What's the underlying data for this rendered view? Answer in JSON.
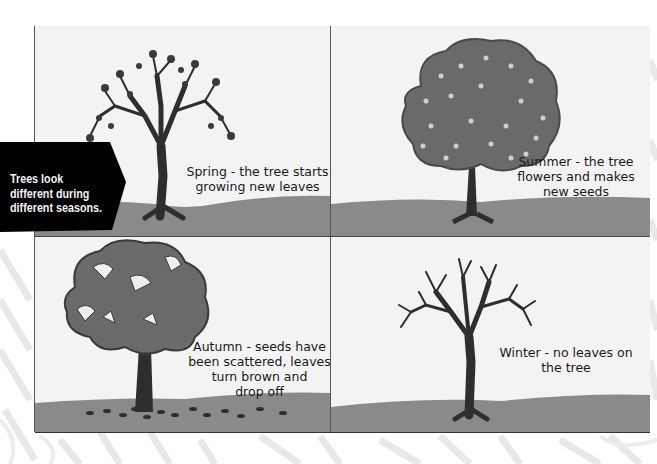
{
  "callout": {
    "lines": [
      "Trees look",
      "different during",
      "different seasons."
    ],
    "background": "#000000",
    "text_color": "#f2f2f2"
  },
  "panels": [
    {
      "season": "Spring",
      "position": "top-left",
      "caption_lines": [
        "Spring - the tree starts",
        "growing new leaves"
      ],
      "tree": "budding-branches-with-leaves"
    },
    {
      "season": "Summer",
      "position": "top-right",
      "caption_lines": [
        "Summer - the tree",
        "flowers and makes",
        "new seeds"
      ],
      "tree": "full-canopy-with-flowers"
    },
    {
      "season": "Autumn",
      "position": "bottom-left",
      "caption_lines": [
        "Autumn - seeds have",
        "been scattered, leaves",
        "turn brown and",
        "drop off"
      ],
      "tree": "canopy-with-gaps-and-fallen-leaves"
    },
    {
      "season": "Winter",
      "position": "bottom-right",
      "caption_lines": [
        "Winter - no leaves on",
        "the tree"
      ],
      "tree": "bare-branches"
    }
  ],
  "colors": {
    "panel_bg": "#f3f3f3",
    "ground": "#8a8a8a",
    "trunk": "#2e2e2e",
    "canopy": "#6a6a6a",
    "divider": "#555555"
  }
}
